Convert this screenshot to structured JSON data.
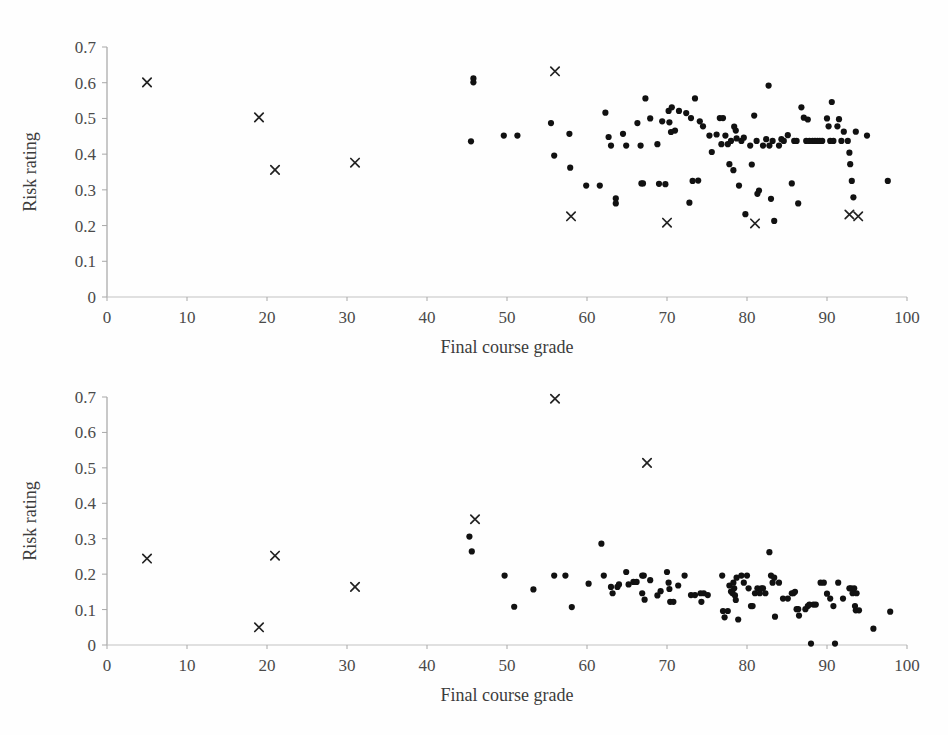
{
  "figure": {
    "background_color": "#fefefe",
    "marker_color": "#111111",
    "axis_color": "#9b9b9b",
    "text_color": "#3a3a3a"
  },
  "chart_data": [
    {
      "id": "top",
      "type": "scatter",
      "title": "",
      "xlabel": "Final course grade",
      "ylabel": "Risk rating",
      "xlim": [
        0,
        100
      ],
      "ylim": [
        0,
        0.7
      ],
      "xticks": [
        0,
        10,
        20,
        30,
        40,
        50,
        60,
        70,
        80,
        90,
        100
      ],
      "xticklabels": [
        "0",
        "10",
        "20",
        "30",
        "40",
        "50",
        "60",
        "70",
        "80",
        "90",
        "100"
      ],
      "yticks": [
        0,
        0.1,
        0.2,
        0.3,
        0.4,
        0.5,
        0.6,
        0.7
      ],
      "yticklabels": [
        "0",
        "0.1",
        "0.2",
        "0.3",
        "0.4",
        "0.5",
        "0.6",
        "0.7"
      ],
      "grid": false,
      "legend": "none",
      "series": [
        {
          "name": "dots",
          "marker": "circle",
          "points": [
            [
              45.8,
              0.612
            ],
            [
              45.8,
              0.601
            ],
            [
              45.5,
              0.436
            ],
            [
              49.6,
              0.452
            ],
            [
              51.3,
              0.452
            ],
            [
              55.5,
              0.487
            ],
            [
              55.9,
              0.396
            ],
            [
              57.8,
              0.457
            ],
            [
              57.9,
              0.362
            ],
            [
              59.9,
              0.312
            ],
            [
              61.6,
              0.312
            ],
            [
              62.3,
              0.516
            ],
            [
              62.7,
              0.448
            ],
            [
              63.0,
              0.424
            ],
            [
              63.6,
              0.276
            ],
            [
              63.6,
              0.262
            ],
            [
              64.5,
              0.457
            ],
            [
              64.9,
              0.424
            ],
            [
              66.3,
              0.487
            ],
            [
              66.7,
              0.424
            ],
            [
              66.8,
              0.318
            ],
            [
              67.0,
              0.318
            ],
            [
              67.3,
              0.556
            ],
            [
              67.9,
              0.5
            ],
            [
              68.8,
              0.428
            ],
            [
              69.0,
              0.317
            ],
            [
              69.4,
              0.492
            ],
            [
              69.8,
              0.316
            ],
            [
              70.2,
              0.521
            ],
            [
              70.3,
              0.489
            ],
            [
              70.5,
              0.462
            ],
            [
              70.6,
              0.531
            ],
            [
              71.0,
              0.466
            ],
            [
              71.5,
              0.521
            ],
            [
              72.4,
              0.515
            ],
            [
              72.8,
              0.264
            ],
            [
              73.0,
              0.501
            ],
            [
              73.2,
              0.325
            ],
            [
              73.5,
              0.556
            ],
            [
              73.9,
              0.326
            ],
            [
              74.1,
              0.492
            ],
            [
              74.5,
              0.478
            ],
            [
              75.3,
              0.452
            ],
            [
              75.6,
              0.406
            ],
            [
              76.2,
              0.455
            ],
            [
              76.6,
              0.501
            ],
            [
              76.8,
              0.428
            ],
            [
              77.0,
              0.501
            ],
            [
              77.3,
              0.452
            ],
            [
              77.6,
              0.428
            ],
            [
              77.8,
              0.372
            ],
            [
              78.0,
              0.437
            ],
            [
              78.3,
              0.355
            ],
            [
              78.4,
              0.477
            ],
            [
              78.6,
              0.466
            ],
            [
              78.7,
              0.444
            ],
            [
              79.0,
              0.312
            ],
            [
              79.3,
              0.437
            ],
            [
              79.6,
              0.446
            ],
            [
              79.8,
              0.232
            ],
            [
              80.4,
              0.424
            ],
            [
              80.6,
              0.371
            ],
            [
              80.9,
              0.508
            ],
            [
              81.2,
              0.437
            ],
            [
              81.3,
              0.289
            ],
            [
              81.5,
              0.298
            ],
            [
              82.0,
              0.424
            ],
            [
              82.4,
              0.442
            ],
            [
              82.7,
              0.592
            ],
            [
              82.8,
              0.424
            ],
            [
              83.0,
              0.275
            ],
            [
              83.2,
              0.437
            ],
            [
              83.4,
              0.213
            ],
            [
              84.0,
              0.424
            ],
            [
              84.3,
              0.442
            ],
            [
              84.6,
              0.437
            ],
            [
              85.1,
              0.453
            ],
            [
              85.6,
              0.318
            ],
            [
              85.9,
              0.437
            ],
            [
              86.2,
              0.437
            ],
            [
              86.4,
              0.262
            ],
            [
              86.8,
              0.531
            ],
            [
              87.1,
              0.502
            ],
            [
              87.4,
              0.437
            ],
            [
              87.6,
              0.497
            ],
            [
              87.8,
              0.437
            ],
            [
              88.2,
              0.437
            ],
            [
              88.5,
              0.437
            ],
            [
              88.8,
              0.437
            ],
            [
              89.1,
              0.437
            ],
            [
              89.4,
              0.437
            ],
            [
              90.0,
              0.5
            ],
            [
              90.2,
              0.478
            ],
            [
              90.4,
              0.437
            ],
            [
              90.6,
              0.546
            ],
            [
              90.8,
              0.437
            ],
            [
              91.3,
              0.478
            ],
            [
              91.5,
              0.498
            ],
            [
              91.8,
              0.437
            ],
            [
              92.1,
              0.463
            ],
            [
              92.6,
              0.437
            ],
            [
              92.8,
              0.404
            ],
            [
              92.9,
              0.372
            ],
            [
              93.1,
              0.325
            ],
            [
              93.3,
              0.279
            ],
            [
              93.6,
              0.463
            ],
            [
              95.0,
              0.452
            ],
            [
              97.6,
              0.325
            ]
          ]
        },
        {
          "name": "crosses",
          "marker": "x",
          "points": [
            [
              5.0,
              0.601
            ],
            [
              19.0,
              0.503
            ],
            [
              21.0,
              0.356
            ],
            [
              31.0,
              0.376
            ],
            [
              56.0,
              0.632
            ],
            [
              58.0,
              0.226
            ],
            [
              70.0,
              0.208
            ],
            [
              81.0,
              0.206
            ],
            [
              92.8,
              0.231
            ],
            [
              93.9,
              0.226
            ]
          ]
        }
      ]
    },
    {
      "id": "bottom",
      "type": "scatter",
      "title": "",
      "xlabel": "Final course grade",
      "ylabel": "Risk rating",
      "xlim": [
        0,
        100
      ],
      "ylim": [
        0,
        0.7
      ],
      "xticks": [
        0,
        10,
        20,
        30,
        40,
        50,
        60,
        70,
        80,
        90,
        100
      ],
      "xticklabels": [
        "0",
        "10",
        "20",
        "30",
        "40",
        "50",
        "60",
        "70",
        "80",
        "90",
        "100"
      ],
      "yticks": [
        0,
        0.1,
        0.2,
        0.3,
        0.4,
        0.5,
        0.6,
        0.7
      ],
      "yticklabels": [
        "0",
        "0.1",
        "0.2",
        "0.3",
        "0.4",
        "0.5",
        "0.6",
        "0.7"
      ],
      "grid": false,
      "legend": "none",
      "series": [
        {
          "name": "dots",
          "marker": "circle",
          "points": [
            [
              45.3,
              0.306
            ],
            [
              45.6,
              0.264
            ],
            [
              49.7,
              0.196
            ],
            [
              50.9,
              0.108
            ],
            [
              53.3,
              0.157
            ],
            [
              55.9,
              0.196
            ],
            [
              57.3,
              0.196
            ],
            [
              58.1,
              0.107
            ],
            [
              60.2,
              0.173
            ],
            [
              61.8,
              0.286
            ],
            [
              62.1,
              0.196
            ],
            [
              63.0,
              0.164
            ],
            [
              63.2,
              0.146
            ],
            [
              63.8,
              0.164
            ],
            [
              64.0,
              0.171
            ],
            [
              64.9,
              0.206
            ],
            [
              65.2,
              0.171
            ],
            [
              65.8,
              0.178
            ],
            [
              66.2,
              0.178
            ],
            [
              66.9,
              0.196
            ],
            [
              66.9,
              0.146
            ],
            [
              67.1,
              0.196
            ],
            [
              67.2,
              0.128
            ],
            [
              67.9,
              0.183
            ],
            [
              68.8,
              0.14
            ],
            [
              69.2,
              0.152
            ],
            [
              70.0,
              0.206
            ],
            [
              70.2,
              0.176
            ],
            [
              70.3,
              0.158
            ],
            [
              70.4,
              0.122
            ],
            [
              70.8,
              0.122
            ],
            [
              71.4,
              0.168
            ],
            [
              72.2,
              0.196
            ],
            [
              73.0,
              0.141
            ],
            [
              73.5,
              0.141
            ],
            [
              74.2,
              0.146
            ],
            [
              74.3,
              0.122
            ],
            [
              74.6,
              0.146
            ],
            [
              75.1,
              0.141
            ],
            [
              76.9,
              0.196
            ],
            [
              77.0,
              0.096
            ],
            [
              77.2,
              0.078
            ],
            [
              77.6,
              0.096
            ],
            [
              77.8,
              0.168
            ],
            [
              78.0,
              0.151
            ],
            [
              78.2,
              0.146
            ],
            [
              78.3,
              0.176
            ],
            [
              78.4,
              0.16
            ],
            [
              78.5,
              0.14
            ],
            [
              78.6,
              0.127
            ],
            [
              78.7,
              0.19
            ],
            [
              78.9,
              0.072
            ],
            [
              79.3,
              0.196
            ],
            [
              79.6,
              0.176
            ],
            [
              80.0,
              0.196
            ],
            [
              80.2,
              0.16
            ],
            [
              80.5,
              0.11
            ],
            [
              80.7,
              0.11
            ],
            [
              81.0,
              0.146
            ],
            [
              81.3,
              0.16
            ],
            [
              81.6,
              0.146
            ],
            [
              81.8,
              0.16
            ],
            [
              82.0,
              0.16
            ],
            [
              82.3,
              0.146
            ],
            [
              82.8,
              0.262
            ],
            [
              83.0,
              0.196
            ],
            [
              83.2,
              0.176
            ],
            [
              83.4,
              0.19
            ],
            [
              83.5,
              0.08
            ],
            [
              84.0,
              0.176
            ],
            [
              84.5,
              0.131
            ],
            [
              85.1,
              0.131
            ],
            [
              85.6,
              0.146
            ],
            [
              85.8,
              0.146
            ],
            [
              86.0,
              0.15
            ],
            [
              86.2,
              0.101
            ],
            [
              86.4,
              0.101
            ],
            [
              86.5,
              0.083
            ],
            [
              87.3,
              0.101
            ],
            [
              87.6,
              0.11
            ],
            [
              87.8,
              0.114
            ],
            [
              88.0,
              0.004
            ],
            [
              88.3,
              0.114
            ],
            [
              88.6,
              0.114
            ],
            [
              89.2,
              0.176
            ],
            [
              89.6,
              0.176
            ],
            [
              90.0,
              0.145
            ],
            [
              90.4,
              0.131
            ],
            [
              90.8,
              0.11
            ],
            [
              91.0,
              0.004
            ],
            [
              91.4,
              0.176
            ],
            [
              92.0,
              0.131
            ],
            [
              92.8,
              0.16
            ],
            [
              93.0,
              0.16
            ],
            [
              93.2,
              0.146
            ],
            [
              93.4,
              0.16
            ],
            [
              93.5,
              0.11
            ],
            [
              93.6,
              0.098
            ],
            [
              93.7,
              0.146
            ],
            [
              94.0,
              0.098
            ],
            [
              95.8,
              0.046
            ],
            [
              97.9,
              0.094
            ]
          ]
        },
        {
          "name": "crosses",
          "marker": "x",
          "points": [
            [
              5.0,
              0.244
            ],
            [
              19.0,
              0.05
            ],
            [
              21.0,
              0.252
            ],
            [
              31.0,
              0.164
            ],
            [
              46.0,
              0.355
            ],
            [
              56.0,
              0.695
            ],
            [
              67.5,
              0.514
            ]
          ]
        }
      ]
    }
  ]
}
